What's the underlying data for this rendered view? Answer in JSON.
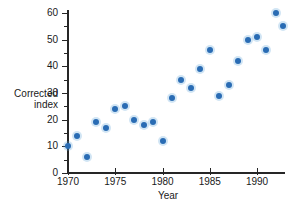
{
  "chart_data": {
    "type": "scatter",
    "title": "",
    "xlabel": "Year",
    "ylabel": "Corrected index",
    "ylabel_lines": [
      "Corrected",
      "index"
    ],
    "xlim": [
      1969.4,
      1992.8
    ],
    "ylim": [
      0,
      62
    ],
    "grid": false,
    "legend": null,
    "point_color": "#2a6cb4",
    "axis_color": "#262626",
    "x_ticks": [
      1970,
      1975,
      1980,
      1985,
      1990
    ],
    "x_tick_labels": [
      "1970",
      "1975",
      "1980",
      "1985",
      "1990"
    ],
    "y_ticks": [
      0,
      10,
      20,
      30,
      40,
      50,
      60
    ],
    "y_tick_labels": [
      "0",
      "10",
      "20",
      "30",
      "40",
      "50",
      "60"
    ],
    "y_minor_ticks": [
      5,
      15,
      25,
      35,
      45,
      55
    ],
    "x": [
      1970,
      1971,
      1972,
      1973,
      1974,
      1975,
      1976,
      1977,
      1978,
      1979,
      1980,
      1981,
      1982,
      1983,
      1984,
      1985,
      1986,
      1987,
      1988,
      1989,
      1990,
      1991,
      1992
    ],
    "y": [
      10,
      14,
      6,
      19,
      17,
      24,
      25,
      20,
      18,
      19,
      12,
      28,
      35,
      32,
      39,
      46,
      29,
      33,
      42,
      50,
      51,
      46,
      60
    ],
    "points": [
      {
        "x": 1970,
        "y": 10
      },
      {
        "x": 1971,
        "y": 14
      },
      {
        "x": 1972,
        "y": 6
      },
      {
        "x": 1973,
        "y": 19
      },
      {
        "x": 1974,
        "y": 17
      },
      {
        "x": 1975,
        "y": 24
      },
      {
        "x": 1976,
        "y": 25
      },
      {
        "x": 1977,
        "y": 20
      },
      {
        "x": 1978,
        "y": 18
      },
      {
        "x": 1979,
        "y": 19
      },
      {
        "x": 1980,
        "y": 12
      },
      {
        "x": 1981,
        "y": 28
      },
      {
        "x": 1982,
        "y": 35
      },
      {
        "x": 1983,
        "y": 32
      },
      {
        "x": 1984,
        "y": 39
      },
      {
        "x": 1985,
        "y": 46
      },
      {
        "x": 1986,
        "y": 29
      },
      {
        "x": 1987,
        "y": 33
      },
      {
        "x": 1988,
        "y": 42
      },
      {
        "x": 1989,
        "y": 50
      },
      {
        "x": 1990,
        "y": 51
      },
      {
        "x": 1991,
        "y": 46
      },
      {
        "x": 1992,
        "y": 60
      },
      {
        "x": 1992.7,
        "y": 55
      }
    ]
  }
}
